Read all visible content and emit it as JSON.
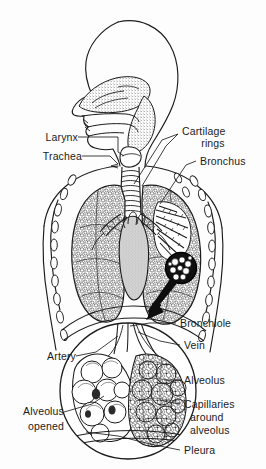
{
  "figure": {
    "background_color": "#fdfdfd",
    "ink_color": "#1b1b1b",
    "width": 266,
    "height": 469
  },
  "labels": {
    "larynx": "Larynx",
    "trachea": "Trachea",
    "cartilage_rings_line1": "Cartilage",
    "cartilage_rings_line2": "rings",
    "bronchus": "Bronchus",
    "bronchiole": "Bronchiole",
    "vein": "Vein",
    "artery": "Artery",
    "alveolus": "Alveolus",
    "capillaries_line1": "Capillaries",
    "capillaries_line2": "around",
    "capillaries_line3": "alveolus",
    "alveolus_opened_line1": "Alveolus",
    "alveolus_opened_line2": "opened",
    "pleura": "Pleura"
  },
  "parts": {
    "head": "head-profile",
    "nasal_cavity": "nasal-cavity",
    "pharynx": "pharynx",
    "larynx_organ": "larynx",
    "trachea_organ": "trachea",
    "left_lung": "left-lung",
    "right_lung": "right-lung",
    "heart": "heart",
    "ribs": "rib-cross-sections",
    "bronchial_tree": "bronchial-tree",
    "magnifier_circle": "magnifier-circle-small",
    "magnifier_arrow": "magnifier-arrow",
    "detail_circle": "alveoli-detail-circle"
  },
  "colors": {
    "ink": "#1b1b1b",
    "stipple": "#555555",
    "heart_fill": "#cfcfcf",
    "lung_fill": "#ffffff",
    "paper": "#fdfdfd"
  }
}
